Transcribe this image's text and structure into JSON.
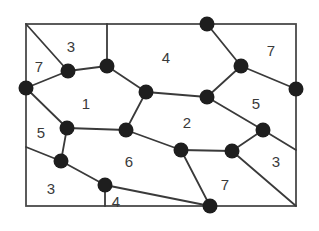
{
  "diagram": {
    "type": "planar-graph-map",
    "frame": {
      "x": 26,
      "y": 24,
      "width": 270,
      "height": 182
    },
    "colors": {
      "line": "#3a3a3a",
      "node": "#1e1e1e",
      "text": "#3a3a3a",
      "background": "#ffffff"
    },
    "nodes": [
      {
        "id": "A",
        "x": 26,
        "y": 88
      },
      {
        "id": "B",
        "x": 68,
        "y": 71
      },
      {
        "id": "C",
        "x": 107,
        "y": 66
      },
      {
        "id": "D",
        "x": 146,
        "y": 92
      },
      {
        "id": "E",
        "x": 207,
        "y": 97
      },
      {
        "id": "F",
        "x": 241,
        "y": 66
      },
      {
        "id": "G",
        "x": 207,
        "y": 24
      },
      {
        "id": "H",
        "x": 296,
        "y": 89
      },
      {
        "id": "I",
        "x": 67,
        "y": 128
      },
      {
        "id": "J",
        "x": 126,
        "y": 130
      },
      {
        "id": "K",
        "x": 181,
        "y": 150
      },
      {
        "id": "L",
        "x": 232,
        "y": 151
      },
      {
        "id": "M",
        "x": 263,
        "y": 130
      },
      {
        "id": "N",
        "x": 61,
        "y": 161
      },
      {
        "id": "O",
        "x": 105,
        "y": 185
      },
      {
        "id": "P",
        "x": 210,
        "y": 206
      }
    ],
    "edges": [
      {
        "x1": 26,
        "y1": 24,
        "x2": 68,
        "y2": 71
      },
      {
        "x1": 26,
        "y1": 88,
        "x2": 68,
        "y2": 71
      },
      {
        "x1": 68,
        "y1": 71,
        "x2": 107,
        "y2": 66
      },
      {
        "x1": 107,
        "y1": 24,
        "x2": 107,
        "y2": 66
      },
      {
        "x1": 107,
        "y1": 66,
        "x2": 146,
        "y2": 92
      },
      {
        "x1": 146,
        "y1": 92,
        "x2": 207,
        "y2": 97
      },
      {
        "x1": 207,
        "y1": 97,
        "x2": 241,
        "y2": 66
      },
      {
        "x1": 207,
        "y1": 24,
        "x2": 241,
        "y2": 66
      },
      {
        "x1": 241,
        "y1": 66,
        "x2": 296,
        "y2": 89
      },
      {
        "x1": 207,
        "y1": 97,
        "x2": 263,
        "y2": 130
      },
      {
        "x1": 263,
        "y1": 130,
        "x2": 296,
        "y2": 150
      },
      {
        "x1": 263,
        "y1": 130,
        "x2": 232,
        "y2": 151
      },
      {
        "x1": 232,
        "y1": 151,
        "x2": 181,
        "y2": 150
      },
      {
        "x1": 232,
        "y1": 151,
        "x2": 296,
        "y2": 206
      },
      {
        "x1": 146,
        "y1": 92,
        "x2": 126,
        "y2": 130
      },
      {
        "x1": 126,
        "y1": 130,
        "x2": 181,
        "y2": 150
      },
      {
        "x1": 181,
        "y1": 150,
        "x2": 210,
        "y2": 206
      },
      {
        "x1": 126,
        "y1": 130,
        "x2": 67,
        "y2": 128
      },
      {
        "x1": 26,
        "y1": 88,
        "x2": 67,
        "y2": 128
      },
      {
        "x1": 67,
        "y1": 128,
        "x2": 61,
        "y2": 161
      },
      {
        "x1": 26,
        "y1": 147,
        "x2": 61,
        "y2": 161
      },
      {
        "x1": 61,
        "y1": 161,
        "x2": 105,
        "y2": 185
      },
      {
        "x1": 105,
        "y1": 185,
        "x2": 105,
        "y2": 206
      },
      {
        "x1": 105,
        "y1": 185,
        "x2": 210,
        "y2": 206
      }
    ],
    "regions": [
      {
        "label": "3",
        "x": 71,
        "y": 48
      },
      {
        "label": "7",
        "x": 39,
        "y": 68
      },
      {
        "label": "4",
        "x": 166,
        "y": 59
      },
      {
        "label": "7",
        "x": 271,
        "y": 52
      },
      {
        "label": "1",
        "x": 86,
        "y": 105
      },
      {
        "label": "5",
        "x": 256,
        "y": 105
      },
      {
        "label": "2",
        "x": 187,
        "y": 124
      },
      {
        "label": "5",
        "x": 41,
        "y": 134
      },
      {
        "label": "6",
        "x": 129,
        "y": 163
      },
      {
        "label": "3",
        "x": 276,
        "y": 163
      },
      {
        "label": "3",
        "x": 51,
        "y": 190
      },
      {
        "label": "7",
        "x": 225,
        "y": 186
      },
      {
        "label": "4",
        "x": 116,
        "y": 203
      }
    ]
  }
}
